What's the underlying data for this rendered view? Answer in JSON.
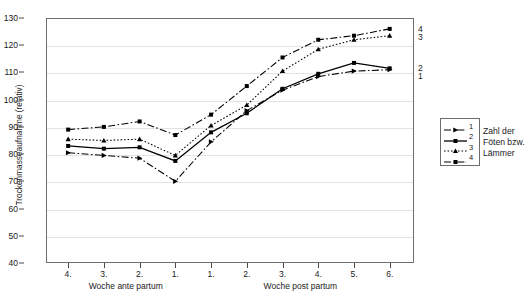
{
  "chart_data": {
    "type": "line",
    "title": "",
    "xlabel_left": "Woche ante partum",
    "xlabel_right": "Woche post partum",
    "ylabel": "Trockenmasseaufnahme (relativ)",
    "categories": [
      "4.",
      "3.",
      "2.",
      "1.",
      "1.",
      "2.",
      "3.",
      "4.",
      "5.",
      "6."
    ],
    "ylim": [
      40,
      130
    ],
    "yticks": [
      40,
      50,
      60,
      70,
      80,
      90,
      100,
      110,
      120,
      130
    ],
    "grid": true,
    "legend_position": "right",
    "series": [
      {
        "name": "1",
        "end_label": "1",
        "style": "dash-dot",
        "marker": "triangle-right",
        "values": [
          80.5,
          79.5,
          78.5,
          70.0,
          84.5,
          96.0,
          103.5,
          108.5,
          110.5,
          111.0
        ]
      },
      {
        "name": "2",
        "end_label": "2",
        "style": "solid",
        "marker": "square",
        "values": [
          83.0,
          82.0,
          82.5,
          77.5,
          88.0,
          95.0,
          104.0,
          109.5,
          113.5,
          111.5
        ]
      },
      {
        "name": "3",
        "end_label": "3",
        "style": "dotted",
        "marker": "triangle-up",
        "values": [
          85.5,
          85.0,
          85.5,
          79.5,
          90.5,
          98.0,
          110.5,
          118.5,
          122.0,
          123.5
        ]
      },
      {
        "name": "4",
        "end_label": "4",
        "style": "dash-dot",
        "marker": "square",
        "values": [
          89.0,
          90.0,
          92.0,
          87.0,
          94.5,
          105.0,
          115.5,
          122.0,
          123.5,
          126.0
        ]
      }
    ]
  },
  "legend": {
    "entries": [
      {
        "num": "1"
      },
      {
        "num": "2"
      },
      {
        "num": "3"
      },
      {
        "num": "4"
      }
    ],
    "caption_line1": "Zahl der",
    "caption_line2": "Föten bzw.",
    "caption_line3": "Lämmer"
  },
  "colors": {
    "line": "#000000",
    "frame": "#6d6d6d",
    "grid": "#e2e2e2",
    "text": "#1a1a1a"
  }
}
